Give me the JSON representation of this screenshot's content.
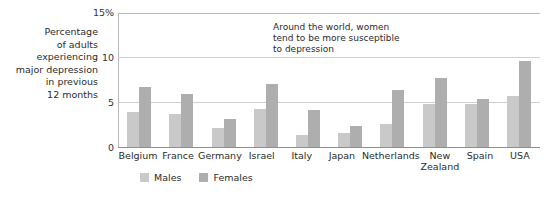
{
  "axis_caption": "Percentage\nof adults\nexperiencing\nmajor depression\nin previous\n12 months",
  "annotation": "Around the world, women\ntend to be more susceptible\nto depression",
  "legend": {
    "male_label": "Males",
    "female_label": "Females"
  },
  "colors": {
    "male": "#c9c9c9",
    "female": "#aeaeae",
    "gridline": "#cfcfcf",
    "axis": "#8f8f8f",
    "text": "#2b2b2b",
    "background": "#ffffff"
  },
  "chart_data": {
    "type": "bar",
    "title": "",
    "xlabel": "",
    "ylabel": "Percentage of adults experiencing major depression in previous 12 months",
    "ylim": [
      0,
      15
    ],
    "yticks": [
      0,
      5,
      10,
      15
    ],
    "ytick_labels": [
      "0",
      "5",
      "10",
      "15%"
    ],
    "grid": true,
    "legend_position": "bottom",
    "annotations": [
      "Around the world, women tend to be more susceptible to depression"
    ],
    "categories": [
      "Belgium",
      "France",
      "Germany",
      "Israel",
      "Italy",
      "Japan",
      "Netherlands",
      "New\nZealand",
      "Spain",
      "USA"
    ],
    "series": [
      {
        "name": "Males",
        "values": [
          4.0,
          3.8,
          2.2,
          4.3,
          1.5,
          1.7,
          2.7,
          4.9,
          4.9,
          5.8
        ]
      },
      {
        "name": "Females",
        "values": [
          6.8,
          6.0,
          3.2,
          7.1,
          4.2,
          2.5,
          6.4,
          7.8,
          5.5,
          9.7
        ]
      }
    ]
  }
}
